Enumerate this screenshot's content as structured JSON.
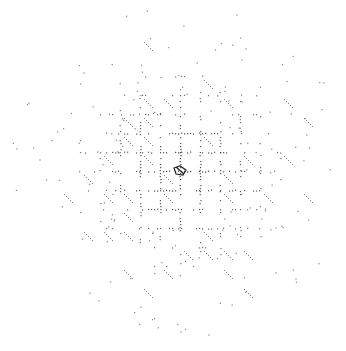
{
  "diagram": {
    "type": "dot-lattice-pattern",
    "background": "#ffffff",
    "dot_color": "#333333",
    "center": [
      180,
      171
    ],
    "grid_spacing_x": 20,
    "grid_spacing_y": 19,
    "grid_half_extent": 7,
    "seed": 12345
  }
}
